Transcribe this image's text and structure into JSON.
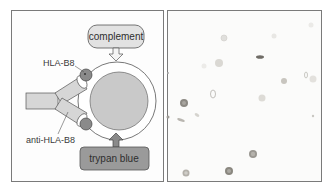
{
  "figure": {
    "left_panel": {
      "type": "schematic",
      "labels": {
        "complement": "complement",
        "antigen": "HLA-B8",
        "antibody": "anti-HLA-B8",
        "dye": "trypan blue"
      },
      "colors": {
        "complement_box": "#e2e2e2",
        "trypan_box": "#9a9a9a",
        "antibody": "#d6d6d6",
        "antigen_dot": "#8a8a8a",
        "nucleus": "#c9c9c9",
        "outline": "#555555"
      }
    },
    "right_panel": {
      "type": "micrograph",
      "description": "cells on light background, some stained dark"
    }
  }
}
